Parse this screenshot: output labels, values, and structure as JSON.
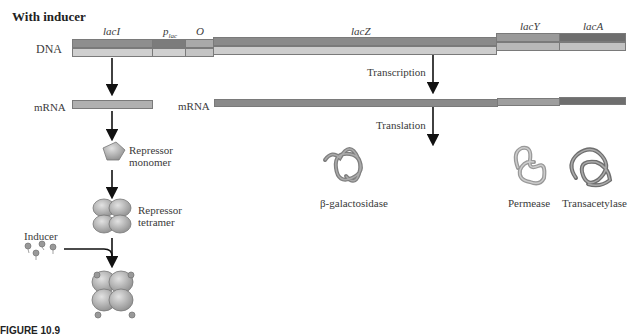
{
  "title": "With inducer",
  "dna": {
    "label": "DNA",
    "genes": [
      {
        "name": "lacI",
        "italic": true
      },
      {
        "name": "p",
        "sub": "lac",
        "italic": true
      },
      {
        "name": "O",
        "italic": true
      },
      {
        "name": "lacZ",
        "italic": true
      },
      {
        "name": "lacY",
        "italic": true
      },
      {
        "name": "lacA",
        "italic": true
      }
    ]
  },
  "mrna": {
    "left_label": "mRNA",
    "right_label": "mRNA"
  },
  "steps": {
    "transcription": "Transcription",
    "translation": "Translation"
  },
  "repressor": {
    "monomer_line1": "Repressor",
    "monomer_line2": "monomer",
    "tetramer_line1": "Repressor",
    "tetramer_line2": "tetramer"
  },
  "inducer": "Inducer",
  "proteins": {
    "galactosidase": "β-galactosidase",
    "permease": "Permease",
    "transacetylase": "Transacetylase"
  },
  "caption": "FIGURE 10.9",
  "colors": {
    "dark_band": "#8a8a8a",
    "light_band": "#c8c8c8",
    "lacA_dark": "#6e6e6e",
    "protein": "#8c8c8c"
  }
}
